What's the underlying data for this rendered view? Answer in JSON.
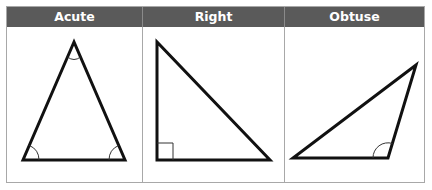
{
  "diagram": {
    "columns": [
      {
        "label": "Acute",
        "angle_markers": [
          "apex arc",
          "bottom-left arc",
          "bottom-right arc"
        ]
      },
      {
        "label": "Right",
        "angle_markers": [
          "right-angle square"
        ]
      },
      {
        "label": "Obtuse",
        "angle_markers": [
          "obtuse arc"
        ]
      }
    ],
    "colors": {
      "header_bg": "#5a5a5a",
      "header_text": "#ffffff",
      "border": "#a8a8a8",
      "stroke": "#111111",
      "marker": "#333333"
    }
  }
}
